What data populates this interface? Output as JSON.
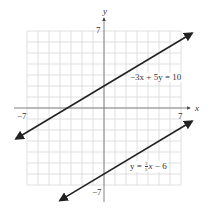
{
  "chart_data": {
    "type": "line",
    "title": "",
    "xlabel": "x",
    "ylabel": "y",
    "xlim": [
      -7,
      7
    ],
    "ylim": [
      -7,
      7
    ],
    "grid": true,
    "tick_labels": {
      "x_min": "−7",
      "x_max": "7",
      "y_min": "−7",
      "y_max": "7"
    },
    "series": [
      {
        "name": "−3x + 5y = 10",
        "equation": "y = 0.6x + 2",
        "slope": 0.6,
        "intercept": 2,
        "x": [
          -8,
          8
        ],
        "values": [
          -2.8,
          6.8
        ],
        "arrows": "both"
      },
      {
        "name": "y = 3/5 x − 6",
        "equation": "y = 0.6x - 6",
        "slope": 0.6,
        "intercept": -6,
        "x": [
          -4,
          8
        ],
        "values": [
          -8.4,
          -1.2
        ],
        "arrows": "both"
      }
    ]
  },
  "labels": {
    "x_axis": "x",
    "y_axis": "y",
    "x_min": "−7",
    "x_max": "7",
    "y_min": "−7",
    "y_max": "7",
    "line1": "−3x + 5y = 10",
    "line2_prefix": "y = ",
    "line2_num": "3",
    "line2_den": "5",
    "line2_var": "x",
    "line2_suffix": " − 6"
  },
  "colors": {
    "grid": "#d8d8d8",
    "axis": "#777777",
    "line": "#222222",
    "text": "#333333"
  }
}
